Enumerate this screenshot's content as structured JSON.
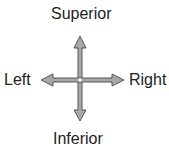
{
  "diagram": {
    "labels": {
      "top": "Superior",
      "left": "Left",
      "right": "Right",
      "bottom": "Inferior"
    },
    "arrow_fill": "#a8a8a8",
    "arrow_stroke": "#555555"
  }
}
